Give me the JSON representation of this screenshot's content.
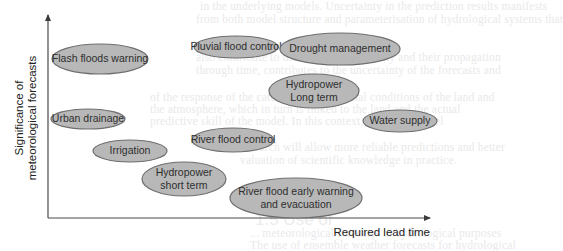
{
  "background": {
    "lines": [
      {
        "text": "in the underlying models. Uncertainty in the prediction results manifests",
        "x": 200,
        "y": 9
      },
      {
        "text": "from both model structure and parameterisation of hydrological systems that",
        "x": 196,
        "y": 22
      },
      {
        "text": "also contribute to the forecast uncertainty and their propagation",
        "x": 196,
        "y": 60
      },
      {
        "text": "through time, contributes to the uncertainty of the forecasts and",
        "x": 196,
        "y": 73
      },
      {
        "text": "of the response of the catchment to the initial conditions of the land and",
        "x": 150,
        "y": 100
      },
      {
        "text": "the atmosphere, which in turn is linked to the land and the actual",
        "x": 150,
        "y": 112
      },
      {
        "text": "predictive skill of the model. In this context, scientific model",
        "x": 150,
        "y": 124
      },
      {
        "text": "research will allow more reliable predictions and better",
        "x": 240,
        "y": 150
      },
      {
        "text": "valuation of scientific knowledge in practice.",
        "x": 240,
        "y": 163
      },
      {
        "text": "... meteorological forecasts to hydrological purposes",
        "x": 250,
        "y": 236
      },
      {
        "text": "The use of ensemble weather forecasts for hydrological",
        "x": 250,
        "y": 248
      }
    ],
    "heading": {
      "text": "1.5 Use of",
      "x": 255,
      "y": 223
    }
  },
  "axes": {
    "y_label_line1": "Significance of",
    "y_label_line2": "meteorological forecasts",
    "x_label": "Required lead time"
  },
  "colors": {
    "ellipse_fill": "#b8b8b8",
    "ellipse_stroke": "#6e6e6e",
    "text": "#2e2e2e",
    "axis": "#4a4a4a"
  },
  "items": [
    {
      "id": "flash-floods-warning",
      "lines": [
        "Flash floods warning"
      ],
      "cx": 100,
      "cy": 59,
      "rx": 48,
      "ry": 15
    },
    {
      "id": "pluvial-flood-control",
      "lines": [
        "Pluvial flood control"
      ],
      "cx": 236,
      "cy": 47,
      "rx": 42,
      "ry": 11
    },
    {
      "id": "drought-management",
      "lines": [
        "Drought management"
      ],
      "cx": 340,
      "cy": 49,
      "rx": 60,
      "ry": 16
    },
    {
      "id": "hydropower-long-term",
      "lines": [
        "Hydropower",
        "Long term"
      ],
      "cx": 314,
      "cy": 91,
      "rx": 45,
      "ry": 17
    },
    {
      "id": "urban-drainage",
      "lines": [
        "Urban drainage"
      ],
      "cx": 88,
      "cy": 119,
      "rx": 37,
      "ry": 10
    },
    {
      "id": "water-supply",
      "lines": [
        "Water supply"
      ],
      "cx": 400,
      "cy": 121,
      "rx": 37,
      "ry": 11
    },
    {
      "id": "river-flood-control",
      "lines": [
        "River flood control"
      ],
      "cx": 233,
      "cy": 140,
      "rx": 41,
      "ry": 12
    },
    {
      "id": "irrigation",
      "lines": [
        "Irrigation"
      ],
      "cx": 130,
      "cy": 151,
      "rx": 37,
      "ry": 11
    },
    {
      "id": "hydropower-short-term",
      "lines": [
        "Hydropower",
        "short term"
      ],
      "cx": 184,
      "cy": 179,
      "rx": 42,
      "ry": 17
    },
    {
      "id": "river-flood-early-warning",
      "lines": [
        "River flood early warning",
        "and evacuation"
      ],
      "cx": 296,
      "cy": 198,
      "rx": 66,
      "ry": 20
    }
  ]
}
